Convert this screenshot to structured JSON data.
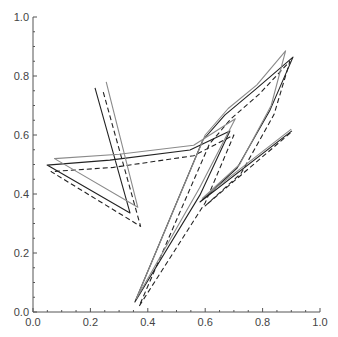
{
  "chart_data": {
    "type": "line",
    "title": "",
    "xlabel": "",
    "ylabel": "",
    "xlim": [
      0.0,
      1.0
    ],
    "ylim": [
      0.0,
      1.0
    ],
    "grid": false,
    "legend": null,
    "x_ticks": [
      "0.0",
      "0.2",
      "0.4",
      "0.6",
      "0.8",
      "1.0"
    ],
    "y_ticks": [
      "0.0",
      "0.2",
      "0.4",
      "0.6",
      "0.8",
      "1.0"
    ],
    "series": [
      {
        "name": "solid-black",
        "color": "#222222",
        "style": "solid",
        "points": [
          [
            0.216,
            0.76
          ],
          [
            0.338,
            0.336
          ],
          [
            0.049,
            0.498
          ],
          [
            0.268,
            0.515
          ],
          [
            0.547,
            0.549
          ],
          [
            0.686,
            0.614
          ],
          [
            0.582,
            0.397
          ],
          [
            0.355,
            0.034
          ],
          [
            0.592,
            0.583
          ],
          [
            0.669,
            0.668
          ],
          [
            0.773,
            0.753
          ],
          [
            0.906,
            0.864
          ],
          [
            0.826,
            0.685
          ],
          [
            0.711,
            0.488
          ],
          [
            0.582,
            0.373
          ],
          [
            0.902,
            0.614
          ]
        ]
      },
      {
        "name": "dashed-black",
        "color": "#222222",
        "style": "dashed",
        "points": [
          [
            0.245,
            0.745
          ],
          [
            0.375,
            0.29
          ],
          [
            0.063,
            0.476
          ],
          [
            0.28,
            0.49
          ],
          [
            0.56,
            0.53
          ],
          [
            0.7,
            0.6
          ],
          [
            0.6,
            0.37
          ],
          [
            0.37,
            0.02
          ],
          [
            0.615,
            0.57
          ],
          [
            0.69,
            0.655
          ],
          [
            0.79,
            0.74
          ],
          [
            0.895,
            0.85
          ],
          [
            0.84,
            0.67
          ],
          [
            0.725,
            0.47
          ],
          [
            0.6,
            0.36
          ],
          [
            0.9,
            0.61
          ]
        ]
      },
      {
        "name": "solid-gray",
        "color": "#8a8a8a",
        "style": "solid",
        "points": [
          [
            0.255,
            0.78
          ],
          [
            0.365,
            0.355
          ],
          [
            0.075,
            0.52
          ],
          [
            0.3,
            0.535
          ],
          [
            0.56,
            0.565
          ],
          [
            0.705,
            0.655
          ],
          [
            0.58,
            0.42
          ],
          [
            0.36,
            0.045
          ],
          [
            0.6,
            0.6
          ],
          [
            0.68,
            0.69
          ],
          [
            0.78,
            0.77
          ],
          [
            0.88,
            0.885
          ],
          [
            0.83,
            0.7
          ],
          [
            0.72,
            0.5
          ],
          [
            0.59,
            0.385
          ],
          [
            0.9,
            0.62
          ]
        ]
      }
    ]
  }
}
